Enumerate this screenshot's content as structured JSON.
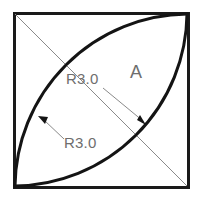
{
  "drawing": {
    "title": "Square with two intersecting arcs",
    "background_color": "#ffffff",
    "outline_color": "#1a1a1a",
    "arc_color": "#141414",
    "leader_color": "#8a8a8a",
    "text_color": "#6e6e6e",
    "square": {
      "x": 13,
      "y": 12,
      "width": 176,
      "height": 176,
      "stroke_width": 3
    },
    "diagonal": {
      "from_x": 14,
      "from_y": 13,
      "to_x": 188,
      "to_y": 187,
      "stroke_width": 1
    },
    "arcs": [
      {
        "name": "left-arc",
        "radius_label": "R3.0",
        "start_x": 188,
        "start_y": 13,
        "end_x": 14,
        "end_y": 187,
        "sweep": 0,
        "stroke_width": 3
      },
      {
        "name": "right-arc",
        "radius_label": "R3.0",
        "start_x": 188,
        "start_y": 13,
        "end_x": 14,
        "end_y": 187,
        "sweep": 1,
        "stroke_width": 3
      }
    ],
    "labels": {
      "zone": "A",
      "zone_x": 130,
      "zone_y": 75,
      "radius_upper": "R3.0",
      "radius_upper_x": 66,
      "radius_upper_y": 82,
      "radius_lower": "R3.0",
      "radius_lower_x": 64,
      "radius_lower_y": 146
    },
    "leaders": [
      {
        "name": "leader-upper-to-right-arc",
        "from_x": 103,
        "from_y": 88,
        "to_x": 144,
        "to_y": 122,
        "arrow": "down-right"
      },
      {
        "name": "leader-lower-to-left-arc",
        "from_x": 62,
        "from_y": 138,
        "to_x": 39,
        "to_y": 117,
        "arrow": "up-left"
      },
      {
        "name": "leader-diagonal-upper-callout",
        "from_x": 14,
        "from_y": 13,
        "to_x": 80,
        "to_y": 72,
        "arrow": "none"
      },
      {
        "name": "leader-diagonal-lower-callout",
        "from_x": 108,
        "from_y": 152,
        "to_x": 188,
        "to_y": 187,
        "arrow": "none"
      }
    ]
  }
}
